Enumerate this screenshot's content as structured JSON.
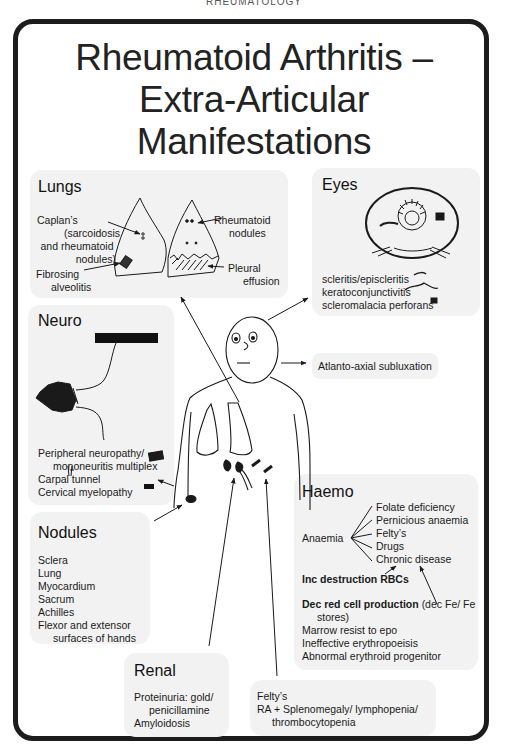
{
  "running_head": "RHEUMATOLOGY",
  "title": {
    "line1": "Rheumatoid Arthritis –",
    "line2": "Extra-Articular",
    "line3": "Manifestations"
  },
  "colors": {
    "frame": "#1c1c1c",
    "panel_bg": "#f2f2f2",
    "text": "#1a1a1a"
  },
  "lungs": {
    "heading": "Lungs",
    "labels": {
      "caplans_1": "Caplan’s",
      "caplans_2": "(sarcoidosis",
      "caplans_3": "and rheumatoid",
      "caplans_4": "nodules)",
      "fibrosing_1": "Fibrosing",
      "fibrosing_2": "alveolitis",
      "rheum_nodules_1": "Rheumatoid",
      "rheum_nodules_2": "nodules",
      "pleural_1": "Pleural",
      "pleural_2": "effusion"
    }
  },
  "eyes": {
    "heading": "Eyes",
    "items": [
      {
        "label": "scleritis/episcleritis",
        "icon": "scleritis-icon"
      },
      {
        "label": "keratoconjunctivitis",
        "icon": "keratoconjunctivitis-icon"
      },
      {
        "label": "scleromalacia perforans",
        "icon": "scleromalacia-icon"
      }
    ]
  },
  "neuro": {
    "heading": "Neuro",
    "items": [
      {
        "label": "Peripheral neuropathy/",
        "icon": "hand-icon"
      },
      {
        "label": "mononeuritis multiplex"
      },
      {
        "label": "Carpal tunnel",
        "icon": "carpal-tunnel-icon"
      },
      {
        "label": "Cervical myelopathy",
        "icon": "bar-icon"
      }
    ]
  },
  "atlanto": {
    "label": "Atlanto-axial subluxation"
  },
  "nodules": {
    "heading": "Nodules",
    "items": [
      "Sclera",
      "Lung",
      "Myocardium",
      "Sacrum",
      "Achilles",
      "Flexor and extensor",
      "surfaces of hands"
    ]
  },
  "haemo": {
    "heading": "Haemo",
    "anaemia": "Anaemia",
    "causes": [
      "Folate deficiency",
      "Pernicious anaemia",
      "Felty’s",
      "Drugs",
      "Chronic disease"
    ],
    "inc_destruction": "Inc destruction RBCs",
    "dec_production_bold": "Dec red cell production",
    "dec_production_rest": "(dec Fe/ Fe",
    "dec_production_cont": "stores)",
    "mechanisms": [
      "Marrow resist to epo",
      "Ineffective erythropoeisis",
      "Abnormal erythroid progenitor"
    ]
  },
  "renal": {
    "heading": "Renal",
    "items": [
      "Proteinuria: gold/",
      "penicillamine",
      "Amyloidosis"
    ]
  },
  "felty": {
    "items": [
      "Felty’s",
      "RA + Splenomegaly/ lymphopenia/",
      "thrombocytopenia"
    ]
  }
}
